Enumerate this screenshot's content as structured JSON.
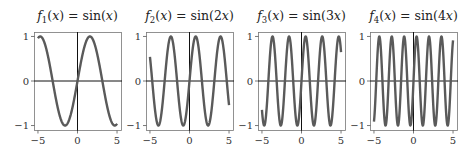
{
  "figure": {
    "width": 476,
    "height": 151,
    "curve_color": "#5a5a5a",
    "axis_color": "#111111",
    "frame_color": "#777777"
  },
  "chart_data": [
    {
      "type": "line",
      "title": "f1(x) = sin(x)",
      "title_parts": {
        "fn": "f",
        "sub": "1",
        "lhs_arg": "(x) = sin(",
        "rhs_arg": "x",
        "close": ")"
      },
      "function": "sin(1x)",
      "frequency": 1,
      "xlabel": "",
      "ylabel": "",
      "xlim": [
        -5.5,
        5.5
      ],
      "ylim": [
        -1.1,
        1.1
      ],
      "xticks": [
        -5,
        0,
        5
      ],
      "xtick_labels": [
        "−5",
        "0",
        "5"
      ],
      "yticks": [
        -1,
        0,
        1
      ],
      "ytick_labels": [
        "−1",
        "0",
        "1"
      ],
      "x_range": [
        -5,
        5
      ],
      "grid": false,
      "series": [
        {
          "name": "sin(x)",
          "x_start": -5,
          "x_end": 5
        }
      ]
    },
    {
      "type": "line",
      "title": "f2(x) = sin(2x)",
      "title_parts": {
        "fn": "f",
        "sub": "2",
        "lhs_arg": "(x) = sin(",
        "rhs_arg": "2x",
        "close": ")"
      },
      "function": "sin(2x)",
      "frequency": 2,
      "xlabel": "",
      "ylabel": "",
      "xlim": [
        -5.5,
        5.5
      ],
      "ylim": [
        -1.1,
        1.1
      ],
      "xticks": [
        -5,
        0,
        5
      ],
      "xtick_labels": [
        "−5",
        "0",
        "5"
      ],
      "yticks": [
        -1,
        0,
        1
      ],
      "ytick_labels": [
        "−1",
        "0",
        "1"
      ],
      "x_range": [
        -5,
        5
      ],
      "grid": false,
      "series": [
        {
          "name": "sin(2x)",
          "x_start": -5,
          "x_end": 5
        }
      ]
    },
    {
      "type": "line",
      "title": "f3(x) = sin(3x)",
      "title_parts": {
        "fn": "f",
        "sub": "3",
        "lhs_arg": "(x) = sin(",
        "rhs_arg": "3x",
        "close": ")"
      },
      "function": "sin(3x)",
      "frequency": 3,
      "xlabel": "",
      "ylabel": "",
      "xlim": [
        -5.5,
        5.5
      ],
      "ylim": [
        -1.1,
        1.1
      ],
      "xticks": [
        -5,
        0,
        5
      ],
      "xtick_labels": [
        "−5",
        "0",
        "5"
      ],
      "yticks": [
        -1,
        0,
        1
      ],
      "ytick_labels": [
        "−1",
        "0",
        "1"
      ],
      "x_range": [
        -5,
        5
      ],
      "grid": false,
      "series": [
        {
          "name": "sin(3x)",
          "x_start": -5,
          "x_end": 5
        }
      ]
    },
    {
      "type": "line",
      "title": "f4(x) = sin(4x)",
      "title_parts": {
        "fn": "f",
        "sub": "4",
        "lhs_arg": "(x) = sin(",
        "rhs_arg": "4x",
        "close": ")"
      },
      "function": "sin(4x)",
      "frequency": 4,
      "xlabel": "",
      "ylabel": "",
      "xlim": [
        -5.5,
        5.5
      ],
      "ylim": [
        -1.1,
        1.1
      ],
      "xticks": [
        -5,
        0,
        5
      ],
      "xtick_labels": [
        "−5",
        "0",
        "5"
      ],
      "yticks": [
        -1,
        0,
        1
      ],
      "ytick_labels": [
        "−1",
        "0",
        "1"
      ],
      "x_range": [
        -5,
        5
      ],
      "grid": false,
      "series": [
        {
          "name": "sin(4x)",
          "x_start": -5,
          "x_end": 5
        }
      ]
    }
  ],
  "layout": {
    "panels": [
      {
        "left": 34,
        "top": 32,
        "width": 87,
        "height": 98
      },
      {
        "left": 146,
        "top": 32,
        "width": 87,
        "height": 98
      },
      {
        "left": 258,
        "top": 32,
        "width": 87,
        "height": 98
      },
      {
        "left": 370,
        "top": 32,
        "width": 87,
        "height": 98
      }
    ]
  }
}
